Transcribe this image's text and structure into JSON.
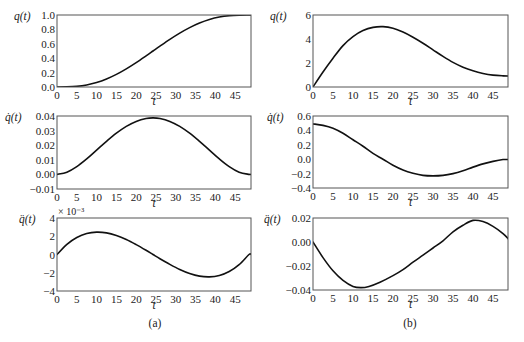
{
  "figure": {
    "captions": {
      "a": "(a)",
      "b": "(b)"
    }
  },
  "chart_data": [
    {
      "id": "a1",
      "panel": "a",
      "type": "line",
      "ylabel": "q(t)",
      "xlabel": "t",
      "multiplier": "",
      "xlim": [
        0,
        49
      ],
      "ylim": [
        0,
        1
      ],
      "xticks": [
        0,
        5,
        10,
        15,
        20,
        25,
        30,
        35,
        40,
        45
      ],
      "yticks": [
        0,
        0.2,
        0.4,
        0.6,
        0.8,
        1.0
      ],
      "ytick_labels": [
        "0.0",
        "0.2",
        "0.4",
        "0.6",
        "0.8",
        "1.0"
      ],
      "x": [
        0,
        2.5,
        5,
        7.5,
        10,
        12.5,
        15,
        17.5,
        20,
        22.5,
        24.25,
        26,
        28.5,
        31,
        33.5,
        36,
        38.5,
        41,
        43.5,
        46,
        48.5,
        49
      ],
      "y": [
        0,
        0.0013,
        0.0093,
        0.0289,
        0.0628,
        0.1118,
        0.1756,
        0.2522,
        0.339,
        0.4326,
        0.5,
        0.5674,
        0.661,
        0.7478,
        0.8244,
        0.8882,
        0.9372,
        0.9711,
        0.9907,
        0.9987,
        1.0,
        1.0
      ]
    },
    {
      "id": "a2",
      "panel": "a",
      "type": "line",
      "ylabel": "q̇(t)",
      "xlabel": "t",
      "multiplier": "",
      "xlim": [
        0,
        49
      ],
      "ylim": [
        -0.01,
        0.04
      ],
      "xticks": [
        0,
        5,
        10,
        15,
        20,
        25,
        30,
        35,
        40,
        45
      ],
      "yticks": [
        -0.01,
        0,
        0.01,
        0.02,
        0.03,
        0.04
      ],
      "ytick_labels": [
        "−0.01",
        "0.00",
        "0.01",
        "0.02",
        "0.03",
        "0.04"
      ],
      "x": [
        0,
        2.5,
        5,
        7.5,
        10,
        12.5,
        15,
        17.5,
        20,
        22.5,
        24.25,
        26,
        28.5,
        31,
        33.5,
        36,
        38.5,
        41,
        43.5,
        46,
        48.5,
        49
      ],
      "y": [
        0,
        0.0015,
        0.0053,
        0.0106,
        0.0166,
        0.0226,
        0.0282,
        0.0329,
        0.0363,
        0.0383,
        0.0387,
        0.0383,
        0.0363,
        0.0329,
        0.0282,
        0.0226,
        0.0166,
        0.0106,
        0.0053,
        0.0015,
        0,
        0
      ]
    },
    {
      "id": "a3",
      "panel": "a",
      "type": "line",
      "ylabel": "q̈(t)",
      "xlabel": "t",
      "multiplier": "× 10⁻³",
      "xlim": [
        0,
        49
      ],
      "ylim": [
        -4,
        4
      ],
      "xticks": [
        0,
        5,
        10,
        15,
        20,
        25,
        30,
        35,
        40,
        45
      ],
      "yticks": [
        -4,
        -2,
        0,
        2,
        4
      ],
      "ytick_labels": [
        "−4",
        "−2",
        "0",
        "2",
        "4"
      ],
      "x": [
        0,
        2.5,
        5,
        7.5,
        10,
        12.5,
        15,
        17.5,
        20,
        22.5,
        24.25,
        26,
        28.5,
        31,
        33.5,
        36,
        38.5,
        41,
        43.5,
        46,
        48.5,
        49
      ],
      "y": [
        0,
        1.12,
        1.87,
        2.3,
        2.45,
        2.37,
        2.08,
        1.64,
        1.08,
        0.46,
        0,
        -0.46,
        -1.08,
        -1.64,
        -2.08,
        -2.37,
        -2.45,
        -2.3,
        -1.87,
        -1.12,
        0,
        0
      ]
    },
    {
      "id": "b1",
      "panel": "b",
      "type": "line",
      "ylabel": "q(t)",
      "xlabel": "t",
      "multiplier": "",
      "xlim": [
        0,
        48.75
      ],
      "ylim": [
        0,
        6
      ],
      "xticks": [
        0,
        5,
        10,
        15,
        20,
        25,
        30,
        35,
        40,
        45
      ],
      "yticks": [
        0,
        2,
        4,
        6
      ],
      "ytick_labels": [
        "0",
        "2",
        "4",
        "6"
      ],
      "x": [
        0,
        2.5,
        5,
        7.5,
        10,
        12.5,
        15,
        17.5,
        20,
        22.5,
        25,
        27.5,
        30,
        32.5,
        35,
        37.5,
        40,
        42.5,
        45,
        47.5,
        49
      ],
      "y": [
        0,
        1.25,
        2.4,
        3.45,
        4.2,
        4.7,
        4.97,
        5.03,
        4.9,
        4.58,
        4.15,
        3.65,
        3.1,
        2.55,
        2.05,
        1.65,
        1.35,
        1.13,
        0.99,
        0.93,
        0.92
      ]
    },
    {
      "id": "b2",
      "panel": "b",
      "type": "line",
      "ylabel": "q̇(t)",
      "xlabel": "t",
      "multiplier": "",
      "xlim": [
        0,
        48.75
      ],
      "ylim": [
        -0.4,
        0.6
      ],
      "xticks": [
        0,
        5,
        10,
        15,
        20,
        25,
        30,
        35,
        40,
        45
      ],
      "yticks": [
        -0.4,
        -0.2,
        0,
        0.2,
        0.4,
        0.6
      ],
      "ytick_labels": [
        "−0.4",
        "−0.2",
        "0.0",
        "0.2",
        "0.4",
        "0.6"
      ],
      "x": [
        0,
        2.5,
        5,
        7.5,
        10,
        12.5,
        15,
        17.5,
        20,
        22.5,
        25,
        27.5,
        30,
        32.5,
        35,
        37.5,
        40,
        42.5,
        45,
        47.5,
        49
      ],
      "y": [
        0.49,
        0.47,
        0.43,
        0.36,
        0.27,
        0.18,
        0.08,
        0.0,
        -0.085,
        -0.15,
        -0.195,
        -0.225,
        -0.232,
        -0.225,
        -0.2,
        -0.16,
        -0.11,
        -0.065,
        -0.03,
        -0.005,
        -0.005
      ]
    },
    {
      "id": "b3",
      "panel": "b",
      "type": "line",
      "ylabel": "q̈(t)",
      "xlabel": "t",
      "multiplier": "",
      "xlim": [
        0,
        48.75
      ],
      "ylim": [
        -0.04,
        0.02
      ],
      "xticks": [
        0,
        5,
        10,
        15,
        20,
        25,
        30,
        35,
        40,
        45
      ],
      "yticks": [
        -0.04,
        -0.02,
        0,
        0.02
      ],
      "ytick_labels": [
        "−0.04",
        "−0.02",
        "0.00",
        "0.02"
      ],
      "x": [
        0,
        2.5,
        5,
        7.5,
        10,
        12,
        14,
        16.75,
        20,
        22.5,
        25,
        27.5,
        30,
        32.5,
        35,
        37.5,
        40,
        42.5,
        45,
        47.5,
        49
      ],
      "y": [
        0,
        -0.013,
        -0.024,
        -0.032,
        -0.037,
        -0.038,
        -0.037,
        -0.0335,
        -0.028,
        -0.023,
        -0.0168,
        -0.011,
        -0.005,
        0.001,
        0.0085,
        0.014,
        0.018,
        0.017,
        0.013,
        0.007,
        0.002
      ]
    }
  ]
}
